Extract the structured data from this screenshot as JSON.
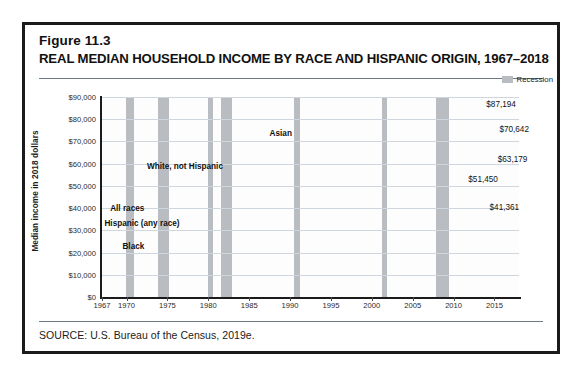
{
  "figure": {
    "number": "Figure 11.3",
    "title": "REAL MEDIAN HOUSEHOLD INCOME BY RACE AND HISPANIC ORIGIN, 1967–2018",
    "source": "SOURCE: U.S. Bureau of the Census, 2019e."
  },
  "legend": {
    "recession_label": "Recession",
    "recession_color": "#b9bcc1"
  },
  "chart_data": {
    "type": "line",
    "title": "REAL MEDIAN HOUSEHOLD INCOME BY RACE AND HISPANIC ORIGIN, 1967–2018",
    "xlabel": "",
    "ylabel": "Median income in 2018 dollars",
    "xlim": [
      1967,
      2018
    ],
    "ylim": [
      0,
      90000
    ],
    "grid": true,
    "legend_position": "top-right",
    "y_ticks": [
      "$0",
      "$10,000",
      "$20,000",
      "$30,000",
      "$40,000",
      "$50,000",
      "$60,000",
      "$70,000",
      "$80,000",
      "$90,000"
    ],
    "y_tick_values": [
      0,
      10000,
      20000,
      30000,
      40000,
      50000,
      60000,
      70000,
      80000,
      90000
    ],
    "x_ticks": [
      "1967",
      "1970",
      "1975",
      "1980",
      "1985",
      "1990",
      "1995",
      "2000",
      "2005",
      "2010",
      "2015"
    ],
    "x_tick_values": [
      1967,
      1970,
      1975,
      1980,
      1985,
      1990,
      1995,
      2000,
      2005,
      2010,
      2015
    ],
    "line_color": "#1f1f1f",
    "series": [
      {
        "name": "Asian",
        "label": "Asian",
        "end_label": "$87,194",
        "end_value": 87194,
        "x": [
          1987,
          1988,
          1989,
          1990,
          1991,
          1992,
          1993,
          1994,
          1995,
          1996,
          1997,
          1998,
          1999,
          2000,
          2001,
          2002,
          2003,
          2004,
          2005,
          2006,
          2007,
          2008,
          2009,
          2010,
          2011,
          2012,
          2013,
          2014,
          2015,
          2016,
          2017,
          2018
        ],
        "values": [
          66500,
          64200,
          66800,
          66200,
          63300,
          63900,
          62700,
          63600,
          65300,
          67100,
          69700,
          72100,
          75400,
          77900,
          73600,
          73900,
          73300,
          72100,
          74900,
          76000,
          76900,
          74800,
          73000,
          71500,
          70000,
          71200,
          71800,
          74500,
          79300,
          82200,
          83400,
          87194
        ]
      },
      {
        "name": "White, not Hispanic",
        "label": "White, not Hispanic",
        "end_label": "$70,642",
        "end_value": 70642,
        "x": [
          1972,
          1973,
          1974,
          1975,
          1976,
          1977,
          1978,
          1979,
          1980,
          1981,
          1982,
          1983,
          1984,
          1985,
          1986,
          1987,
          1988,
          1989,
          1990,
          1991,
          1992,
          1993,
          1994,
          1995,
          1996,
          1997,
          1998,
          1999,
          2000,
          2001,
          2002,
          2003,
          2004,
          2005,
          2006,
          2007,
          2008,
          2009,
          2010,
          2011,
          2012,
          2013,
          2014,
          2015,
          2016,
          2017,
          2018
        ],
        "values": [
          52200,
          53500,
          52000,
          51000,
          51800,
          52200,
          53600,
          53700,
          52000,
          51200,
          50800,
          51300,
          52500,
          53500,
          55300,
          56200,
          56800,
          57900,
          56800,
          55600,
          55200,
          54800,
          55300,
          56400,
          57400,
          58900,
          60900,
          62300,
          62700,
          61800,
          61500,
          61300,
          61400,
          61300,
          62100,
          62600,
          61400,
          60100,
          59100,
          58200,
          58100,
          58900,
          60000,
          62300,
          64900,
          67400,
          70642
        ]
      },
      {
        "name": "All races",
        "label": "All races",
        "end_label": "$63,179",
        "end_value": 63179,
        "x": [
          1967,
          1968,
          1969,
          1970,
          1971,
          1972,
          1973,
          1974,
          1975,
          1976,
          1977,
          1978,
          1979,
          1980,
          1981,
          1982,
          1983,
          1984,
          1985,
          1986,
          1987,
          1988,
          1989,
          1990,
          1991,
          1992,
          1993,
          1994,
          1995,
          1996,
          1997,
          1998,
          1999,
          2000,
          2001,
          2002,
          2003,
          2004,
          2005,
          2006,
          2007,
          2008,
          2009,
          2010,
          2011,
          2012,
          2013,
          2014,
          2015,
          2016,
          2017,
          2018
        ],
        "values": [
          44000,
          45800,
          47100,
          46800,
          46400,
          48200,
          49300,
          47900,
          46900,
          47500,
          47800,
          49200,
          49400,
          47700,
          46800,
          46300,
          46400,
          47600,
          48600,
          50200,
          51000,
          51500,
          52400,
          51300,
          49800,
          49400,
          49000,
          49600,
          50900,
          51800,
          53100,
          55000,
          56400,
          56800,
          55600,
          55100,
          55000,
          55000,
          55500,
          56300,
          57300,
          55600,
          54800,
          53500,
          52700,
          52600,
          54000,
          54400,
          57200,
          59000,
          61100,
          63179
        ]
      },
      {
        "name": "Hispanic (any race)",
        "label": "Hispanic (any race)",
        "end_label": "$51,450",
        "end_value": 51450,
        "x": [
          1972,
          1973,
          1974,
          1975,
          1976,
          1977,
          1978,
          1979,
          1980,
          1981,
          1982,
          1983,
          1984,
          1985,
          1986,
          1987,
          1988,
          1989,
          1990,
          1991,
          1992,
          1993,
          1994,
          1995,
          1996,
          1997,
          1998,
          1999,
          2000,
          2001,
          2002,
          2003,
          2004,
          2005,
          2006,
          2007,
          2008,
          2009,
          2010,
          2011,
          2012,
          2013,
          2014,
          2015,
          2016,
          2017,
          2018
        ],
        "values": [
          38500,
          38800,
          37800,
          36200,
          36900,
          37200,
          38400,
          38700,
          37100,
          36100,
          35400,
          35700,
          36600,
          36900,
          37600,
          38400,
          38300,
          39300,
          38300,
          37300,
          36700,
          35600,
          35900,
          36100,
          36900,
          38600,
          39800,
          41600,
          42700,
          41800,
          41400,
          41000,
          41500,
          41600,
          42600,
          43300,
          42100,
          40600,
          40200,
          39700,
          40100,
          41100,
          42600,
          45500,
          47400,
          49400,
          51450
        ]
      },
      {
        "name": "Black",
        "label": "Black",
        "end_label": "$41,361",
        "end_value": 41361,
        "x": [
          1967,
          1968,
          1969,
          1970,
          1971,
          1972,
          1973,
          1974,
          1975,
          1976,
          1977,
          1978,
          1979,
          1980,
          1981,
          1982,
          1983,
          1984,
          1985,
          1986,
          1987,
          1988,
          1989,
          1990,
          1991,
          1992,
          1993,
          1994,
          1995,
          1996,
          1997,
          1998,
          1999,
          2000,
          2001,
          2002,
          2003,
          2004,
          2005,
          2006,
          2007,
          2008,
          2009,
          2010,
          2011,
          2012,
          2013,
          2014,
          2015,
          2016,
          2017,
          2018
        ],
        "values": [
          26000,
          27100,
          28400,
          28500,
          28300,
          28900,
          29100,
          28700,
          28400,
          28900,
          28600,
          30100,
          30000,
          28500,
          27800,
          27500,
          27700,
          28400,
          29100,
          30100,
          30300,
          30400,
          31400,
          30700,
          29700,
          29000,
          29100,
          30100,
          31100,
          31600,
          32800,
          34000,
          35200,
          36000,
          35000,
          34500,
          34200,
          34000,
          34500,
          35100,
          35500,
          34400,
          33600,
          33400,
          32900,
          33000,
          34200,
          35200,
          37000,
          39500,
          40500,
          41361
        ]
      }
    ],
    "recessions": [
      {
        "start": 1969.9,
        "end": 1970.9
      },
      {
        "start": 1973.9,
        "end": 1975.2
      },
      {
        "start": 1980.0,
        "end": 1980.6
      },
      {
        "start": 1981.5,
        "end": 1982.9
      },
      {
        "start": 1990.5,
        "end": 1991.2
      },
      {
        "start": 2001.2,
        "end": 2001.9
      },
      {
        "start": 2007.9,
        "end": 2009.5
      }
    ],
    "series_label_positions": [
      {
        "name": "Asian",
        "x": 1987.5,
        "y": 73500
      },
      {
        "name": "White, not Hispanic",
        "x": 1972.5,
        "y": 58500
      },
      {
        "name": "All races",
        "x": 1968.0,
        "y": 39500
      },
      {
        "name": "Hispanic (any race)",
        "x": 1967.3,
        "y": 32800
      },
      {
        "name": "Black",
        "x": 1969.5,
        "y": 22500
      }
    ],
    "end_label_positions": [
      {
        "name": "Asian",
        "x": 2014.0,
        "y": 86500
      },
      {
        "name": "White, not Hispanic",
        "x": 2015.6,
        "y": 75000
      },
      {
        "name": "All races",
        "x": 2015.4,
        "y": 61500
      },
      {
        "name": "Hispanic (any race)",
        "x": 2011.8,
        "y": 52500
      },
      {
        "name": "Black",
        "x": 2014.4,
        "y": 40000
      }
    ]
  }
}
